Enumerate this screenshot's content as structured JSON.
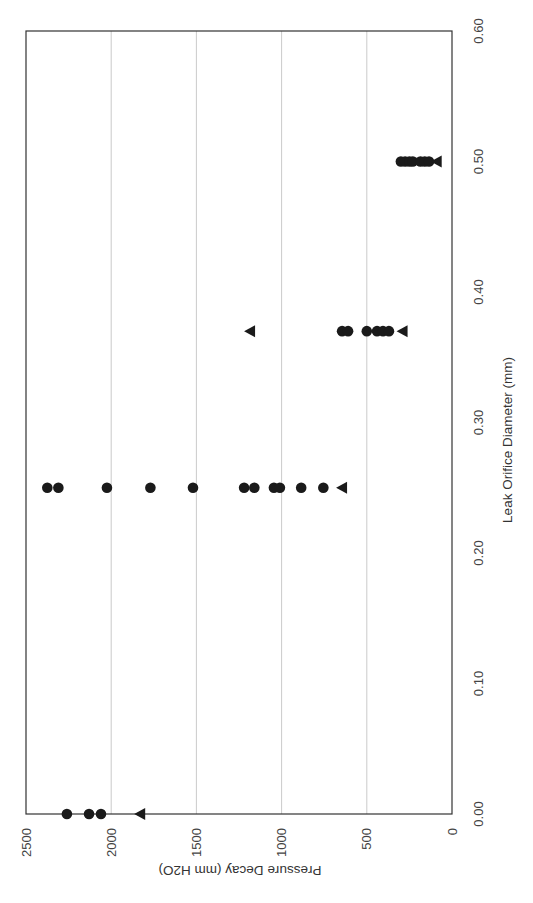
{
  "chart_data": {
    "type": "scatter",
    "orientation_note_visual": "rotated 90deg clockwise",
    "title": "",
    "xlabel": "Leak Orifice Diameter (mm)",
    "ylabel": "Pressure Decay (mm H2O)",
    "xlim": [
      0,
      0.6
    ],
    "ylim": [
      0,
      2500
    ],
    "x_ticks": [
      "0.00",
      "0.10",
      "0.20",
      "0.30",
      "0.40",
      "0.50",
      "0.60"
    ],
    "y_ticks": [
      "0",
      "500",
      "1000",
      "1500",
      "2000",
      "2500"
    ],
    "grid": {
      "y_major": true,
      "x_major": false
    },
    "legend": null,
    "series": [
      {
        "name": "circle",
        "marker": "circle",
        "color": "#1a1a1a",
        "points": [
          [
            0.0,
            2260
          ],
          [
            0.0,
            2130
          ],
          [
            0.0,
            2060
          ],
          [
            0.25,
            2375
          ],
          [
            0.25,
            2310
          ],
          [
            0.25,
            2025
          ],
          [
            0.25,
            1770
          ],
          [
            0.25,
            1520
          ],
          [
            0.25,
            1220
          ],
          [
            0.25,
            1160
          ],
          [
            0.25,
            1045
          ],
          [
            0.25,
            1010
          ],
          [
            0.25,
            885
          ],
          [
            0.25,
            755
          ],
          [
            0.37,
            645
          ],
          [
            0.37,
            610
          ],
          [
            0.37,
            500
          ],
          [
            0.37,
            440
          ],
          [
            0.37,
            405
          ],
          [
            0.37,
            370
          ],
          [
            0.5,
            300
          ],
          [
            0.5,
            275
          ],
          [
            0.5,
            250
          ],
          [
            0.5,
            230
          ],
          [
            0.5,
            185
          ],
          [
            0.5,
            160
          ],
          [
            0.5,
            135
          ]
        ]
      },
      {
        "name": "triangle",
        "marker": "triangle",
        "color": "#1a1a1a",
        "points": [
          [
            0.0,
            1830
          ],
          [
            0.25,
            645
          ],
          [
            0.37,
            1185
          ],
          [
            0.37,
            290
          ],
          [
            0.5,
            90
          ]
        ]
      }
    ]
  },
  "labels": {
    "xlabel": "Leak Orifice Diameter (mm)",
    "ylabel": "Pressure Decay (mm H2O)",
    "x_ticks": [
      "0.00",
      "0.10",
      "0.20",
      "0.30",
      "0.40",
      "0.50",
      "0.60"
    ],
    "y_ticks": [
      "0",
      "500",
      "1000",
      "1500",
      "2000",
      "2500"
    ]
  }
}
